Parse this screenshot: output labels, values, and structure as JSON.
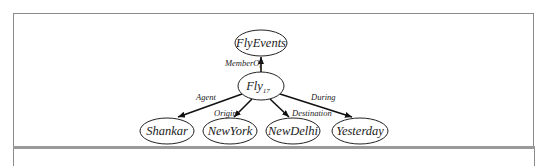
{
  "diagram": {
    "type": "semantic-network",
    "nodes": [
      {
        "id": "flyevents",
        "label": "FlyEvents",
        "sub": ""
      },
      {
        "id": "fly17",
        "label": "Fly",
        "sub": "17"
      },
      {
        "id": "shankar",
        "label": "Shankar",
        "sub": ""
      },
      {
        "id": "newyork",
        "label": "NewYork",
        "sub": ""
      },
      {
        "id": "newdelhi",
        "label": "NewDelhi",
        "sub": ""
      },
      {
        "id": "yesterday",
        "label": "Yesterday",
        "sub": ""
      }
    ],
    "edges": [
      {
        "from": "fly17",
        "to": "flyevents",
        "label": "MemberOf"
      },
      {
        "from": "fly17",
        "to": "shankar",
        "label": "Agent"
      },
      {
        "from": "fly17",
        "to": "newyork",
        "label": "Origin"
      },
      {
        "from": "fly17",
        "to": "newdelhi",
        "label": "Destination"
      },
      {
        "from": "fly17",
        "to": "yesterday",
        "label": "During"
      }
    ]
  }
}
